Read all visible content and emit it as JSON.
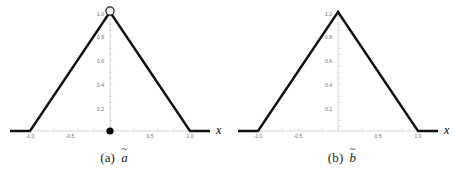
{
  "figure": {
    "panels": [
      {
        "id": "panel-a",
        "caption_tag": "(a)",
        "caption_symbol": "a",
        "caption_tilde": "~",
        "axis_label_x": "x",
        "peak_label": "1.0",
        "has_open_circle_at_peak": "true",
        "has_filled_dot_at_origin": "true"
      },
      {
        "id": "panel-b",
        "caption_tag": "(b)",
        "caption_symbol": "b",
        "caption_tilde": "~",
        "axis_label_x": "x",
        "peak_label": "1.0",
        "has_open_circle_at_peak": "false",
        "has_filled_dot_at_origin": "false"
      }
    ]
  },
  "colors": {
    "curve": "#111111",
    "axis": "#c8c8c8",
    "tick_text": "#6e6e6e",
    "marker_fill": "#000000",
    "marker_open_fill": "#f2f2f2",
    "background": "#ffffff"
  },
  "chart_data": [
    {
      "type": "line",
      "title": "(a) a-tilde",
      "xlabel": "x",
      "ylabel": "",
      "xlim": [
        -1.25,
        1.25
      ],
      "ylim": [
        0,
        1.05
      ],
      "grid": false,
      "legend": "none",
      "xticks": [
        -1.0,
        -0.5,
        0.5,
        1.0
      ],
      "xticklabels": [
        "-1.0",
        "-0.5",
        "0.5",
        "1.0"
      ],
      "yticks": [
        0.2,
        0.4,
        0.6,
        0.8,
        1.0
      ],
      "yticklabels": [
        "0.2",
        "0.4",
        "0.6",
        "0.8",
        "1.0"
      ],
      "series": [
        {
          "name": "membership",
          "x": [
            -1.25,
            -1.0,
            0.0,
            1.0,
            1.25
          ],
          "y": [
            0,
            0,
            1,
            0,
            0
          ]
        }
      ],
      "annotations": [
        {
          "kind": "open-circle",
          "x": 0.0,
          "y": 1.0,
          "label": "1.0"
        },
        {
          "kind": "filled-dot",
          "x": 0.0,
          "y": 0.0,
          "label": ""
        }
      ]
    },
    {
      "type": "line",
      "title": "(b) b-tilde",
      "xlabel": "x",
      "ylabel": "",
      "xlim": [
        -1.25,
        1.25
      ],
      "ylim": [
        0,
        1.05
      ],
      "grid": false,
      "legend": "none",
      "xticks": [
        -1.0,
        -0.5,
        0.5,
        1.0
      ],
      "xticklabels": [
        "-1.0",
        "-0.5",
        "0.5",
        "1.0"
      ],
      "yticks": [
        0.2,
        0.4,
        0.6,
        0.8,
        1.0
      ],
      "yticklabels": [
        "0.2",
        "0.4",
        "0.6",
        "0.8",
        "1.0"
      ],
      "series": [
        {
          "name": "membership",
          "x": [
            -1.25,
            -1.0,
            0.0,
            1.0,
            1.25
          ],
          "y": [
            0,
            0,
            1,
            0,
            0
          ]
        }
      ],
      "annotations": []
    }
  ],
  "ticks": {
    "x": [
      "-1.0",
      "-0.5",
      "0.5",
      "1.0"
    ],
    "y": [
      "0.2",
      "0.4",
      "0.6",
      "0.8"
    ],
    "peak": "1.0"
  }
}
